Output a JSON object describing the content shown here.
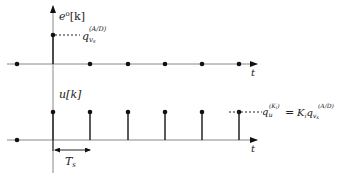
{
  "diagram": {
    "top_plot": {
      "y_label_main": "e",
      "y_label_sup": "o",
      "y_label_arg": "[k]",
      "x_label": "t",
      "level_label_main": "q",
      "level_label_sub": "v",
      "level_label_subsub": "s",
      "level_label_sup": "(A/D)"
    },
    "bottom_plot": {
      "y_label": "u[k]",
      "x_label": "t",
      "level_label_lhs_main": "q",
      "level_label_lhs_sub": "u",
      "level_label_lhs_sup": "(K",
      "level_label_lhs_sup_sub": "i",
      "level_label_lhs_sup_close": ")",
      "equals": "=",
      "level_label_rhs_K": "K",
      "level_label_rhs_K_sub": "i",
      "level_label_rhs_q": "q",
      "level_label_rhs_sub": "v",
      "level_label_rhs_subsub": "s",
      "level_label_rhs_sup": "(A/D)",
      "period_label_main": "T",
      "period_label_sub": "s"
    },
    "colors": {
      "line": "#333333",
      "axis": "#888888",
      "dot": "#111111"
    }
  }
}
